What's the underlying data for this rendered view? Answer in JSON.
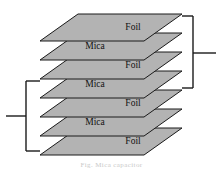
{
  "figure": {
    "caption": "Fig. Mica capacitor",
    "background_color": "#ffffff",
    "plate_fill_color": "#b3b3b3",
    "plate_stroke_color": "#1a1a1a",
    "label_color": "#111111",
    "bracket_color": "#1a1a1a"
  },
  "geometry": {
    "plate_width": 104,
    "plate_skew_x": 38,
    "plate_skew_y": 27,
    "layer_spacing": 19,
    "first_plate_top_x": 78,
    "first_plate_top_y": 14,
    "first_plate_left_x": 40,
    "first_plate_left_y": 41
  },
  "stack": {
    "name": "plate-stack",
    "layer_count": 7,
    "layers": [
      {
        "index": 0,
        "label": "Foil",
        "material": "foil",
        "label_dx": 22,
        "label_dy": 0
      },
      {
        "index": 1,
        "label": "Mica",
        "material": "mica",
        "label_dx": -16,
        "label_dy": 0
      },
      {
        "index": 2,
        "label": "Foil",
        "material": "foil",
        "label_dx": 22,
        "label_dy": 0
      },
      {
        "index": 3,
        "label": "Mica",
        "material": "mica",
        "label_dx": -16,
        "label_dy": 0
      },
      {
        "index": 4,
        "label": "Foil",
        "material": "foil",
        "label_dx": 22,
        "label_dy": 0
      },
      {
        "index": 5,
        "label": "Mica",
        "material": "mica",
        "label_dx": -16,
        "label_dy": 0
      },
      {
        "index": 6,
        "label": "Foil",
        "material": "foil",
        "label_dx": 22,
        "label_dy": 0
      }
    ]
  },
  "terminals": [
    {
      "name": "right-terminal",
      "side": "right",
      "bracket_x": 193,
      "bracket_top_y": 16,
      "bracket_bottom_y": 88,
      "arm_end_x": 182,
      "lead_y": 53,
      "lead_end_x": 216,
      "connects_layers": [
        0,
        2,
        4
      ]
    },
    {
      "name": "left-terminal",
      "side": "left",
      "bracket_x": 26,
      "bracket_top_y": 81,
      "bracket_bottom_y": 151,
      "arm_end_x": 40,
      "lead_y": 116,
      "lead_end_x": 6,
      "connects_layers": [
        2,
        4,
        6
      ]
    }
  ]
}
